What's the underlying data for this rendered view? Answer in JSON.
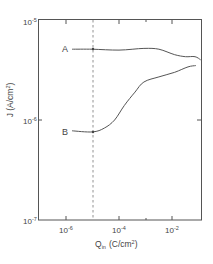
{
  "chart_data": {
    "type": "line",
    "title": "",
    "xlabel": "Q_in (C/cm²)",
    "xlabel_main": "Q",
    "xlabel_sub": "in",
    "xlabel_unit": "(C/cm",
    "xlabel_unit_sup": "2",
    "xlabel_unit_end": ")",
    "ylabel": "J (A/cm²)",
    "ylabel_main": "J (A/cm",
    "ylabel_sup": "2",
    "ylabel_end": ")",
    "xscale": "log",
    "yscale": "log",
    "xlim": [
      1e-07,
      0.12
    ],
    "ylim": [
      1e-07,
      1e-05
    ],
    "grid": false,
    "legend": "inline labels at left end of curves",
    "x_tick_labels": [
      {
        "base": "10",
        "exp": "-6",
        "value": 1e-06
      },
      {
        "base": "10",
        "exp": "-4",
        "value": 0.0001
      },
      {
        "base": "10",
        "exp": "-2",
        "value": 0.01
      }
    ],
    "x_minor_ticks": [
      1e-05,
      0.001
    ],
    "y_tick_labels": [
      {
        "base": "10",
        "exp": "-5",
        "value": 1e-05
      },
      {
        "base": "10",
        "exp": "-6",
        "value": 1e-06
      },
      {
        "base": "10",
        "exp": "-7",
        "value": 1e-07
      }
    ],
    "annotations": [
      {
        "type": "vertical-dashed-line",
        "x": 1e-05
      }
    ],
    "series": [
      {
        "name": "A",
        "x": [
          1.7e-06,
          1e-05,
          0.0001,
          0.00087,
          0.0032,
          0.0126,
          0.032,
          0.074,
          0.12
        ],
        "y": [
          5.1e-06,
          5.1e-06,
          5e-06,
          5.2e-06,
          5.1e-06,
          4.5e-06,
          4.3e-06,
          4.3e-06,
          4e-06
        ]
      },
      {
        "name": "B",
        "x": [
          1.7e-06,
          1e-05,
          2.8e-05,
          6.8e-05,
          0.00016,
          0.0004,
          0.00087,
          0.0032,
          0.0126,
          0.04,
          0.079
        ],
        "y": [
          7.8e-07,
          7.6e-07,
          8.3e-07,
          1e-06,
          1.4e-06,
          1.9e-06,
          2.4e-06,
          2.7e-06,
          3e-06,
          3.4e-06,
          3.5e-06
        ]
      }
    ]
  }
}
